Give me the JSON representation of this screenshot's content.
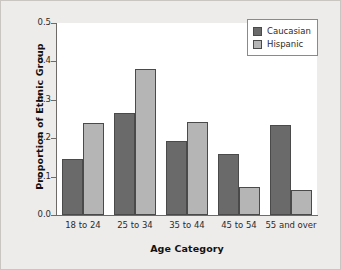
{
  "chart_data": {
    "type": "bar",
    "title": "",
    "xlabel": "Age Category",
    "ylabel": "Proportion of Ethnic Group",
    "categories": [
      "18 to 24",
      "25 to 34",
      "35 to 44",
      "45 to 54",
      "55 and over"
    ],
    "series": [
      {
        "name": "Caucasian",
        "color": "#6a6a6a",
        "values": [
          0.147,
          0.265,
          0.193,
          0.16,
          0.235
        ]
      },
      {
        "name": "Hispanic",
        "color": "#b5b5b5",
        "values": [
          0.24,
          0.38,
          0.242,
          0.072,
          0.065
        ]
      }
    ],
    "ylim": [
      0.0,
      0.5
    ],
    "yticks": [
      "0.0",
      "0.1",
      "0.2",
      "0.3",
      "0.4",
      "0.5"
    ],
    "ytick_values": [
      0.0,
      0.1,
      0.2,
      0.3,
      0.4,
      0.5
    ],
    "grid": false,
    "legend_position": "top-right",
    "legend_entries": [
      "Caucasian",
      "Hispanic"
    ]
  }
}
